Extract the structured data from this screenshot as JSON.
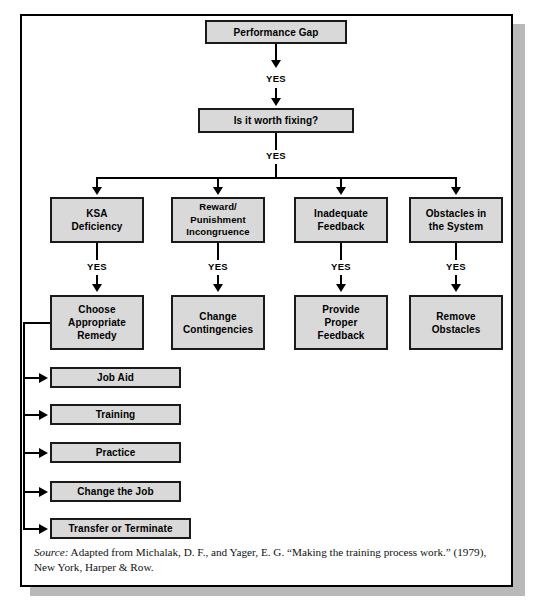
{
  "figure": {
    "nodes": {
      "performance_gap": "Performance Gap",
      "worth_fixing": "Is it worth fixing?",
      "ksa_deficiency": "KSA\nDeficiency",
      "reward_punishment": "Reward/\nPunishment\nIncongruence",
      "inadequate_feedback": "Inadequate\nFeedback",
      "obstacles_system": "Obstacles in\nthe System",
      "choose_remedy": "Choose\nAppropriate\nRemedy",
      "change_contingencies": "Change\nContingencies",
      "provide_feedback": "Provide\nProper\nFeedback",
      "remove_obstacles": "Remove\nObstacles"
    },
    "remedies": [
      "Job Aid",
      "Training",
      "Practice",
      "Change the Job",
      "Transfer or Terminate"
    ],
    "edge_labels": {
      "yes_1": "YES",
      "yes_2": "YES",
      "yes_ksa": "YES",
      "yes_reward": "YES",
      "yes_feedback": "YES",
      "yes_obstacles": "YES"
    },
    "source": {
      "label": "Source:",
      "text": " Adapted from Michalak, D. F., and Yager, E. G. “Making the training process work.” (1979), New York, Harper & Row."
    },
    "colors": {
      "box_fill": "#d9d9d9",
      "box_border": "#1a1a1a",
      "frame_border": "#000000",
      "shadow": "#b9b9b9",
      "page_background": "#ffffff"
    }
  }
}
